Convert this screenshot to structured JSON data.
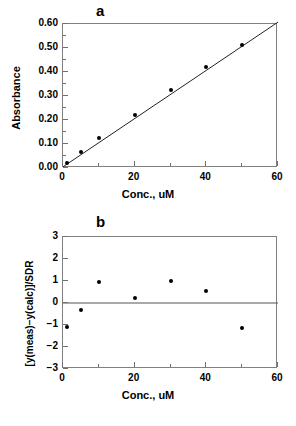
{
  "figure": {
    "panel_a_letter": "a",
    "panel_b_letter": "b"
  },
  "chart_data": [
    {
      "type": "scatter",
      "panel": "a",
      "title": "a",
      "xlabel": "Conc.,  uM",
      "ylabel": "Absorbance",
      "xlim": [
        0,
        60
      ],
      "ylim": [
        0.0,
        0.6
      ],
      "xticks": [
        0,
        20,
        40,
        60
      ],
      "xtick_labels": [
        "0",
        "20",
        "40",
        "60"
      ],
      "xminor_ticks": [
        10,
        30,
        50
      ],
      "yticks": [
        0.0,
        0.1,
        0.2,
        0.3,
        0.4,
        0.5,
        0.6
      ],
      "ytick_labels": [
        "0.00",
        "0.10",
        "0.20",
        "0.30",
        "0.40",
        "0.50",
        "0.60"
      ],
      "yminor_ticks": [
        0.05,
        0.15,
        0.25,
        0.35,
        0.45,
        0.55
      ],
      "grid": false,
      "legend": "none",
      "x": [
        1,
        5,
        10,
        20,
        30,
        40,
        50
      ],
      "y": [
        0.022,
        0.066,
        0.124,
        0.221,
        0.324,
        0.422,
        0.511
      ],
      "fit_line": {
        "name": "least-squares fit",
        "x": [
          0,
          60
        ],
        "y": [
          0.005,
          0.608
        ]
      }
    },
    {
      "type": "scatter",
      "panel": "b",
      "title": "b",
      "xlabel": "Conc.,  uM",
      "ylabel": "[y(meas)−y(calc)]/SDR",
      "xlim": [
        0,
        60
      ],
      "ylim": [
        -3,
        3
      ],
      "xticks": [
        0,
        20,
        40,
        60
      ],
      "xtick_labels": [
        "0",
        "20",
        "40",
        "60"
      ],
      "xminor_ticks": [
        10,
        30,
        50
      ],
      "yticks": [
        -3,
        -2,
        -1,
        0,
        1,
        2,
        3
      ],
      "ytick_labels": [
        "−3",
        "−2",
        "−1",
        "0",
        "1",
        "2",
        "3"
      ],
      "grid": false,
      "legend": "none",
      "x": [
        1,
        5,
        10,
        20,
        30,
        40,
        50
      ],
      "y": [
        -1.1,
        -0.3,
        0.95,
        0.25,
        1.0,
        0.55,
        -1.15
      ],
      "zero_line": {
        "name": "zero reference",
        "y": 0
      }
    }
  ],
  "colors": {
    "axis": "#808080",
    "marker": "#000000",
    "line": "#333333",
    "text": "#000000",
    "background": "#ffffff"
  }
}
